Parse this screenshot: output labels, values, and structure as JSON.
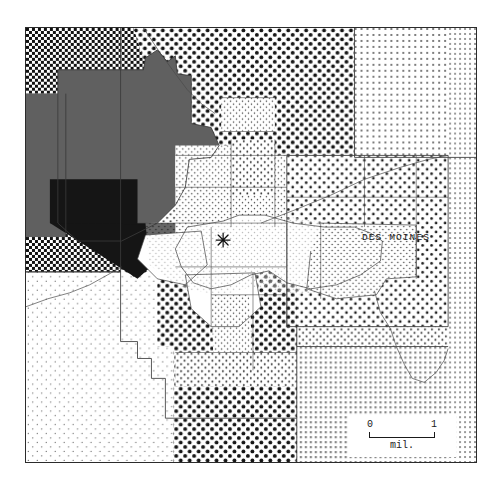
{
  "map": {
    "title": "Des Moines metropolitan area choropleth map",
    "city_label": "DES MOINES",
    "center_marker": "star-marker",
    "frame": {
      "x": 25,
      "y": 27,
      "width": 452,
      "height": 436
    }
  },
  "scalebar": {
    "min_label": "0",
    "max_label": "1",
    "unit_label": "mil.",
    "length_units": 1
  },
  "colors": {
    "background": "#ffffff",
    "frame_stroke": "#2b2b2b",
    "boundary_stroke": "#3a3a3a",
    "thin_line": "#4a4a4a",
    "ink": "#141414",
    "class_black": "#151515",
    "class_dark_gray": "#606060"
  },
  "legend_classes": [
    {
      "name": "solid-black",
      "pattern": "solid",
      "tone": "#151515"
    },
    {
      "name": "dark-gray",
      "pattern": "solid",
      "tone": "#606060"
    },
    {
      "name": "coarse-dense-dots",
      "pattern": "dots",
      "spacing": 6,
      "radius": 2.0,
      "tone": "#111111"
    },
    {
      "name": "coarse-dots",
      "pattern": "dots",
      "spacing": 9,
      "radius": 1.9,
      "tone": "#151515"
    },
    {
      "name": "medium-dots",
      "pattern": "dots",
      "spacing": 9,
      "radius": 1.35,
      "tone": "#1d1d1d"
    },
    {
      "name": "fine-dots",
      "pattern": "dots",
      "spacing": 7,
      "radius": 0.95,
      "tone": "#2a2a2a"
    },
    {
      "name": "very-fine-dots",
      "pattern": "dots",
      "spacing": 6,
      "radius": 0.7,
      "tone": "#3a3a3a"
    },
    {
      "name": "sparse-dots",
      "pattern": "dots",
      "spacing": 9,
      "radius": 0.62,
      "tone": "#4a4a4a"
    },
    {
      "name": "grid-fine",
      "pattern": "grid",
      "spacing": 5,
      "tone": "#8a8a8a"
    },
    {
      "name": "white",
      "pattern": "none",
      "tone": "#ffffff"
    }
  ]
}
